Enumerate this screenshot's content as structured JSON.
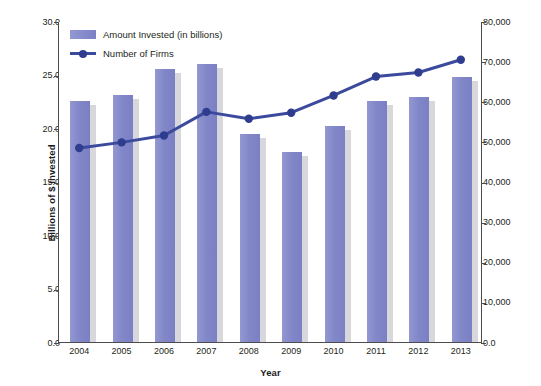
{
  "chart_data": {
    "type": "bar",
    "title": "",
    "subtitle": "",
    "xlabel": "Year",
    "ylabel": "Billions of $ Invested",
    "y2label": "Number of Small Companies",
    "categories": [
      "2004",
      "2005",
      "2006",
      "2007",
      "2008",
      "2009",
      "2010",
      "2011",
      "2012",
      "2013"
    ],
    "ylim": [
      0,
      30
    ],
    "y2lim": [
      0,
      80000
    ],
    "yticks": [
      "0.0",
      "5.0",
      "10.0",
      "15.0",
      "20.0",
      "25.0",
      "30.0"
    ],
    "ytick_values": [
      0,
      5,
      10,
      15,
      20,
      25,
      30
    ],
    "y2ticks": [
      "0.0",
      "10,000",
      "20,000",
      "30,000",
      "40,000",
      "50,000",
      "60,000",
      "70,000",
      "80,000"
    ],
    "y2tick_values": [
      0,
      10000,
      20000,
      30000,
      40000,
      50000,
      60000,
      70000,
      80000
    ],
    "grid": false,
    "legend_position": "top-left",
    "series": [
      {
        "name": "Amount Invested (in billions)",
        "type": "bar",
        "axis": "left",
        "color": "#8287c8",
        "values": [
          22.5,
          23.1,
          25.5,
          26.0,
          19.4,
          17.8,
          20.2,
          22.5,
          22.9,
          24.8
        ]
      },
      {
        "name": "Number of Firms",
        "type": "line",
        "axis": "right",
        "color": "#3b4a9c",
        "values": [
          48600,
          50000,
          51700,
          57600,
          55900,
          57400,
          61700,
          66400,
          67400,
          70600
        ]
      }
    ]
  },
  "colors": {
    "bar_fill": "#8287c8",
    "bar_shadow": "#d8d8dc",
    "line": "#3b4a9c",
    "marker": "#2f3d8e",
    "axis": "#4c4c4c",
    "text": "#231f20",
    "background": "#ffffff"
  }
}
